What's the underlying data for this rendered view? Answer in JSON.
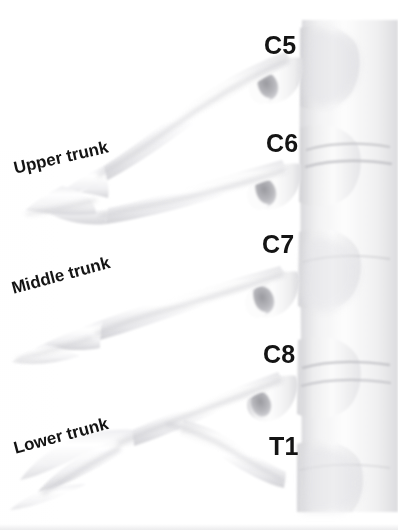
{
  "figure": {
    "background_color": "#ffffff",
    "label_color": "#141414",
    "style": "grayscale anatomical illustration"
  },
  "vertebra_labels": [
    {
      "text": "C5",
      "x": 264,
      "y": 33
    },
    {
      "text": "C6",
      "x": 266,
      "y": 131
    },
    {
      "text": "C7",
      "x": 262,
      "y": 232
    },
    {
      "text": "C8",
      "x": 263,
      "y": 342
    },
    {
      "text": "T1",
      "x": 269,
      "y": 434
    }
  ],
  "trunk_labels": [
    {
      "text": "Upper trunk",
      "x": 14,
      "y": 160,
      "rotation": -13
    },
    {
      "text": "Middle trunk",
      "x": 12,
      "y": 280,
      "rotation": -15
    },
    {
      "text": "Lower trunk",
      "x": 14,
      "y": 440,
      "rotation": -15
    }
  ]
}
